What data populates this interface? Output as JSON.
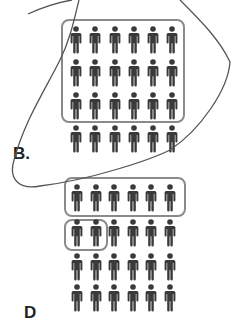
{
  "figures": [
    {
      "label": "B.",
      "rows": 4,
      "cols": 6,
      "highlight_boxes": [
        {
          "description": "top three rows",
          "rows": [
            1,
            3
          ],
          "cols": [
            1,
            6
          ]
        }
      ]
    },
    {
      "label": "D",
      "rows": 4,
      "cols": 6,
      "highlight_boxes": [
        {
          "description": "first row",
          "rows": [
            1,
            1
          ],
          "cols": [
            1,
            6
          ]
        },
        {
          "description": "first two in second row",
          "rows": [
            2,
            2
          ],
          "cols": [
            1,
            2
          ]
        }
      ]
    }
  ],
  "colors": {
    "person": "#3a3a3a",
    "box": "#8a8a8a",
    "annotation_stroke": "#555555"
  }
}
